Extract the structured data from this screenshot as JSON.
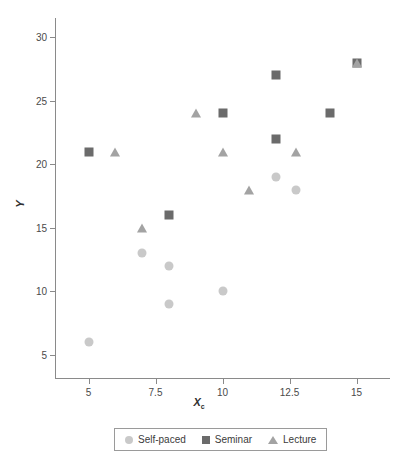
{
  "chart_data": {
    "type": "scatter",
    "title": "",
    "xlabel": "X",
    "xlabel_subscript": "c",
    "ylabel": "Y",
    "xlim": [
      3.75,
      16.25
    ],
    "ylim": [
      3.2,
      31.5
    ],
    "grid": false,
    "legend_position": "bottom",
    "xticks": [
      "5",
      "7.5",
      "10",
      "12.5",
      "15"
    ],
    "xtick_values": [
      5,
      7.5,
      10,
      12.5,
      15
    ],
    "yticks": [
      "5",
      "10",
      "15",
      "20",
      "25",
      "30"
    ],
    "ytick_values": [
      5,
      10,
      15,
      20,
      25,
      30
    ],
    "series": [
      {
        "name": "Self-paced",
        "marker": "circle",
        "color": "#c9c9c9",
        "points": [
          {
            "x": 5,
            "y": 6
          },
          {
            "x": 7,
            "y": 13
          },
          {
            "x": 8,
            "y": 12
          },
          {
            "x": 8,
            "y": 9
          },
          {
            "x": 10,
            "y": 10
          },
          {
            "x": 12,
            "y": 19
          },
          {
            "x": 12.75,
            "y": 18
          }
        ]
      },
      {
        "name": "Seminar",
        "marker": "square",
        "color": "#6b6b6b",
        "points": [
          {
            "x": 5,
            "y": 21
          },
          {
            "x": 8,
            "y": 16
          },
          {
            "x": 10,
            "y": 24
          },
          {
            "x": 12,
            "y": 27
          },
          {
            "x": 12,
            "y": 22
          },
          {
            "x": 14,
            "y": 24
          },
          {
            "x": 15,
            "y": 28
          }
        ]
      },
      {
        "name": "Lecture",
        "marker": "triangle",
        "color": "#a3a3a3",
        "points": [
          {
            "x": 6,
            "y": 21
          },
          {
            "x": 7,
            "y": 15
          },
          {
            "x": 9,
            "y": 24
          },
          {
            "x": 10,
            "y": 21
          },
          {
            "x": 11,
            "y": 18
          },
          {
            "x": 12.75,
            "y": 21
          },
          {
            "x": 15,
            "y": 28
          }
        ]
      }
    ]
  },
  "legend": {
    "entries": [
      {
        "label": "Self-paced",
        "marker": "circle",
        "color": "#c9c9c9"
      },
      {
        "label": "Seminar",
        "marker": "square",
        "color": "#6b6b6b"
      },
      {
        "label": "Lecture",
        "marker": "triangle",
        "color": "#a3a3a3"
      }
    ]
  },
  "colors": {
    "axis": "#8a8a8a",
    "text": "#3b3b3b",
    "background": "#ffffff"
  }
}
